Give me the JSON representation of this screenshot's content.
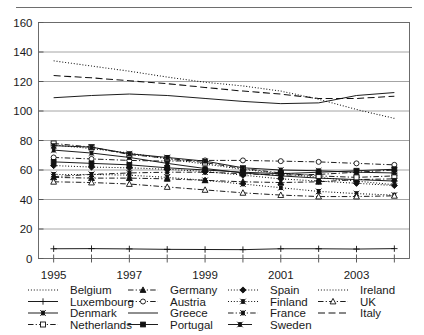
{
  "figure": {
    "has_top_rule": true,
    "background": "#ffffff",
    "ink_color": "#111111"
  },
  "chart_data": {
    "type": "line",
    "title": "",
    "subtitle": "",
    "xlabel": "",
    "ylabel": "",
    "grid": "horizontal",
    "legend_position": "bottom",
    "x": [
      1995,
      1996,
      1997,
      1998,
      1999,
      2000,
      2001,
      2002,
      2003,
      2004
    ],
    "xtick_labels": [
      "1995",
      "1997",
      "1999",
      "2001",
      "2003"
    ],
    "xtick_values": [
      1995,
      1997,
      1999,
      2001,
      2003
    ],
    "xlim": [
      1994.6,
      2004.4
    ],
    "ytick_labels": [
      "0",
      "20",
      "40",
      "60",
      "80",
      "100",
      "120",
      "140",
      "160"
    ],
    "ytick_values": [
      0,
      20,
      40,
      60,
      80,
      100,
      120,
      140,
      160
    ],
    "ylim": [
      0,
      160
    ],
    "series": [
      {
        "name": "Belgium",
        "line_style": "dotted",
        "marker": "none",
        "values": [
          77.0,
          74.5,
          71.5,
          67.5,
          64.0,
          60.5,
          57.5,
          55.0,
          52.5,
          50.0
        ]
      },
      {
        "name": "Germany",
        "line_style": "dash-dot",
        "marker": "triangle-up-filled",
        "values": [
          55.0,
          54.5,
          54.5,
          54.0,
          53.0,
          52.0,
          51.5,
          52.0,
          53.5,
          54.0
        ]
      },
      {
        "name": "Spain",
        "line_style": "dotted",
        "marker": "diamond-filled",
        "values": [
          63.0,
          62.0,
          61.5,
          60.5,
          59.0,
          56.5,
          54.0,
          52.5,
          51.0,
          49.5
        ]
      },
      {
        "name": "Ireland",
        "line_style": "dotted",
        "marker": "none",
        "values": [
          134.0,
          130.5,
          127.0,
          123.0,
          119.5,
          117.0,
          113.5,
          108.0,
          101.0,
          95.0
        ]
      },
      {
        "name": "Luxembourg",
        "line_style": "solid",
        "marker": "plus",
        "values": [
          6.6,
          6.7,
          6.5,
          6.2,
          6.1,
          6.0,
          6.6,
          6.6,
          6.4,
          6.7
        ]
      },
      {
        "name": "Austria",
        "line_style": "dash-dot",
        "marker": "circle-open",
        "values": [
          68.5,
          67.5,
          66.5,
          66.0,
          66.5,
          66.5,
          66.0,
          65.5,
          64.5,
          63.5
        ]
      },
      {
        "name": "Finland",
        "line_style": "dotted",
        "marker": "x-filled",
        "values": [
          57.0,
          57.0,
          56.5,
          55.0,
          53.0,
          50.5,
          48.0,
          45.5,
          44.0,
          43.0
        ]
      },
      {
        "name": "UK",
        "line_style": "dash-dot",
        "marker": "triangle-up-open",
        "values": [
          52.0,
          51.5,
          50.5,
          48.5,
          46.5,
          44.5,
          43.0,
          42.0,
          42.0,
          42.5
        ]
      },
      {
        "name": "Denmark",
        "line_style": "solid",
        "marker": "x-filled",
        "values": [
          73.5,
          71.5,
          68.5,
          64.5,
          61.0,
          58.0,
          56.0,
          54.5,
          53.5,
          52.5
        ]
      },
      {
        "name": "Greece",
        "line_style": "solid",
        "marker": "none",
        "values": [
          109.0,
          110.5,
          111.5,
          110.5,
          108.5,
          106.5,
          105.0,
          105.5,
          110.5,
          112.5
        ]
      },
      {
        "name": "France",
        "line_style": "dash-dot",
        "marker": "x-filled",
        "values": [
          55.5,
          57.0,
          58.0,
          58.5,
          58.5,
          57.5,
          56.5,
          57.0,
          58.5,
          60.0
        ]
      },
      {
        "name": "Italy",
        "line_style": "dashed",
        "marker": "none",
        "values": [
          124.0,
          122.5,
          120.5,
          118.5,
          116.0,
          113.5,
          111.5,
          108.5,
          108.5,
          110.0
        ]
      },
      {
        "name": "Netherlands",
        "line_style": "dash-dot",
        "marker": "square-open",
        "values": [
          78.0,
          75.5,
          70.5,
          68.0,
          65.0,
          61.0,
          58.0,
          56.0,
          55.0,
          56.0
        ]
      },
      {
        "name": "Portugal",
        "line_style": "solid",
        "marker": "square-filled",
        "values": [
          65.5,
          64.5,
          63.5,
          61.5,
          60.0,
          58.5,
          57.5,
          58.5,
          59.5,
          60.5
        ]
      },
      {
        "name": "Sweden",
        "line_style": "solid-short",
        "marker": "x-filled",
        "values": [
          76.5,
          75.5,
          71.0,
          68.5,
          66.0,
          61.5,
          60.0,
          59.5,
          58.5,
          58.0
        ]
      }
    ]
  },
  "legend": {
    "columns": [
      [
        {
          "label": "Belgium",
          "series": "Belgium"
        },
        {
          "label": "Luxembourg",
          "series": "Luxembourg"
        },
        {
          "label": "Denmark",
          "series": "Denmark"
        },
        {
          "label": "Netherlands",
          "series": "Netherlands"
        }
      ],
      [
        {
          "label": "Germany",
          "series": "Germany"
        },
        {
          "label": "Austria",
          "series": "Austria"
        },
        {
          "label": "Greece",
          "series": "Greece"
        },
        {
          "label": "Portugal",
          "series": "Portugal"
        }
      ],
      [
        {
          "label": "Spain",
          "series": "Spain"
        },
        {
          "label": "Finland",
          "series": "Finland"
        },
        {
          "label": "France",
          "series": "France"
        },
        {
          "label": "Sweden",
          "series": "Sweden"
        }
      ],
      [
        {
          "label": "Ireland",
          "series": "Ireland"
        },
        {
          "label": "UK",
          "series": "UK"
        },
        {
          "label": "Italy",
          "series": "Italy"
        }
      ]
    ]
  }
}
